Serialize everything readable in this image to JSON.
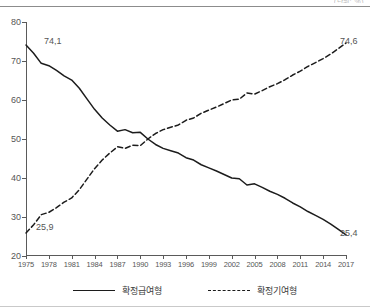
{
  "unit_fragment": "(단위: %)",
  "chart_data": {
    "type": "line",
    "title": "",
    "subtitle": "",
    "xlabel": "",
    "ylabel": "",
    "xlim": [
      1975,
      2017
    ],
    "ylim": [
      20,
      80
    ],
    "grid": false,
    "legend_position": "bottom",
    "y_ticks": [
      20,
      30,
      40,
      50,
      60,
      70,
      80
    ],
    "y_tick_labels": [
      "20",
      "30",
      "40",
      "50",
      "60",
      "70",
      "80"
    ],
    "x_ticks": [
      1975,
      1978,
      1981,
      1984,
      1987,
      1990,
      1993,
      1996,
      1999,
      2002,
      2005,
      2008,
      2011,
      2014,
      2017
    ],
    "x_tick_labels": [
      "1975",
      "1978",
      "1981",
      "1984",
      "1987",
      "1990",
      "1993",
      "1996",
      "1999",
      "2002",
      "2005",
      "2008",
      "2011",
      "2014",
      "2017"
    ],
    "x": [
      1975,
      1976,
      1977,
      1978,
      1979,
      1980,
      1981,
      1982,
      1983,
      1984,
      1985,
      1986,
      1987,
      1988,
      1989,
      1990,
      1991,
      1992,
      1993,
      1994,
      1995,
      1996,
      1997,
      1998,
      1999,
      2000,
      2001,
      2002,
      2003,
      2004,
      2005,
      2006,
      2007,
      2008,
      2009,
      2010,
      2011,
      2012,
      2013,
      2014,
      2015,
      2016,
      2017
    ],
    "series": [
      {
        "name": "확정급여형",
        "style": "solid",
        "color": "#1c1c1c",
        "values": [
          74.1,
          72.0,
          69.4,
          68.8,
          67.6,
          66.2,
          65.1,
          63.0,
          60.3,
          57.6,
          55.4,
          53.6,
          52.0,
          52.4,
          51.6,
          51.7,
          50.0,
          48.6,
          47.6,
          47.0,
          46.4,
          45.2,
          44.6,
          43.4,
          42.6,
          41.8,
          40.9,
          40.0,
          39.8,
          38.2,
          38.5,
          37.6,
          36.6,
          35.8,
          34.8,
          33.6,
          32.6,
          31.4,
          30.4,
          29.4,
          28.2,
          26.8,
          25.4
        ]
      },
      {
        "name": "확정기여형",
        "style": "dashed",
        "color": "#1c1c1c",
        "values": [
          25.9,
          28.0,
          30.6,
          31.2,
          32.4,
          33.8,
          34.9,
          37.0,
          39.7,
          42.4,
          44.6,
          46.4,
          48.0,
          47.6,
          48.4,
          48.3,
          50.0,
          51.4,
          52.4,
          53.0,
          53.6,
          54.8,
          55.4,
          56.6,
          57.4,
          58.2,
          59.1,
          60.0,
          60.2,
          61.8,
          61.5,
          62.4,
          63.4,
          64.2,
          65.2,
          66.4,
          67.4,
          68.6,
          69.6,
          70.6,
          71.8,
          73.2,
          74.6
        ]
      }
    ],
    "annotations": [
      {
        "id": "db-start",
        "text": "74,1",
        "series": "확정급여형",
        "x": 1975,
        "y": 74.1
      },
      {
        "id": "dc-start",
        "text": "25,9",
        "series": "확정기여형",
        "x": 1975,
        "y": 25.9
      },
      {
        "id": "dc-end",
        "text": "74,6",
        "series": "확정기여형",
        "x": 2017,
        "y": 74.6
      },
      {
        "id": "db-end",
        "text": "25,4",
        "series": "확정급여형",
        "x": 2017,
        "y": 25.4
      }
    ]
  }
}
